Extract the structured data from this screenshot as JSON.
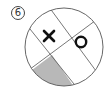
{
  "figure": {
    "number_label": "6",
    "marks": [
      {
        "symbol": "X",
        "x": 49,
        "y": 36
      },
      {
        "symbol": "O",
        "x": 81,
        "y": 42
      }
    ],
    "shaded_region": "bottom-left sector",
    "colors": {
      "stroke": "#555555",
      "mark": "#111111",
      "shade": "#b8b8b8",
      "background": "#ffffff"
    }
  }
}
